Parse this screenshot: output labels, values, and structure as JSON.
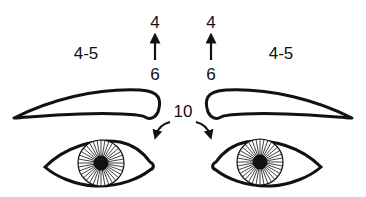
{
  "diagram": {
    "labels": {
      "left_lateral": "4-5",
      "right_lateral": "4-5",
      "left_top": "4",
      "left_bottom": "6",
      "right_top": "4",
      "right_bottom": "6",
      "glabella": "10"
    },
    "colors": {
      "stroke": "#111111",
      "background": "#ffffff"
    },
    "elements": [
      {
        "name": "left-eyebrow"
      },
      {
        "name": "right-eyebrow"
      },
      {
        "name": "left-eye"
      },
      {
        "name": "right-eye"
      },
      {
        "name": "left-up-arrow"
      },
      {
        "name": "right-up-arrow"
      },
      {
        "name": "curved-arrow-left"
      },
      {
        "name": "curved-arrow-right"
      }
    ]
  }
}
